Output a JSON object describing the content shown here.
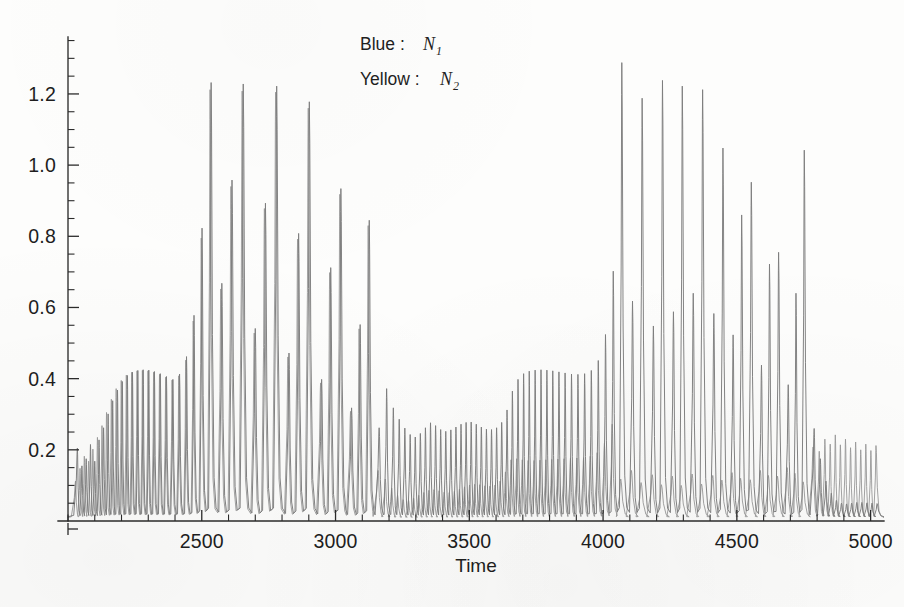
{
  "figure": {
    "background_color": "#fdfdfc",
    "ink_color": "#2b2b2b"
  },
  "legend": {
    "position": "top-center",
    "entries": [
      {
        "label": "Blue :",
        "variable": "N",
        "subscript": "1",
        "series_key": "N1",
        "color": "#7d7d7d"
      },
      {
        "label": "Yellow :",
        "variable": "N",
        "subscript": "2",
        "series_key": "N2",
        "color": "#9a9a9a"
      }
    ]
  },
  "axes": {
    "x": {
      "label": "Time",
      "min": 2000,
      "max": 5050,
      "major_ticks": [
        2500,
        3000,
        3500,
        4000,
        4500,
        5000
      ],
      "major_tick_labels": [
        "2500",
        "3000",
        "3500",
        "4000",
        "4500",
        "5000"
      ],
      "minor_tick_step": 100,
      "tick_direction": "inward"
    },
    "y": {
      "label": "",
      "min": 0.0,
      "max": 1.36,
      "major_ticks": [
        0.2,
        0.4,
        0.6,
        0.8,
        1.0,
        1.2
      ],
      "major_tick_labels": [
        "0.2",
        "0.4",
        "0.6",
        "0.8",
        "1.0",
        "1.2"
      ],
      "minor_tick_step": 0.05,
      "tick_direction": "inward"
    },
    "grid": false,
    "frame": "left-and-bottom-spines-only"
  },
  "chart_data": {
    "type": "line",
    "title": "",
    "xlabel": "Time",
    "ylabel": "",
    "xlim": [
      2000,
      5050
    ],
    "ylim": [
      0.0,
      1.36
    ],
    "grid": false,
    "legend_position": "top-center",
    "series": [
      {
        "name": "N1",
        "legend": "Blue : N1",
        "color": "#7d7d7d",
        "baseline": 0.012,
        "spike_peaks": [
          {
            "t": 2035,
            "y": 0.205
          },
          {
            "t": 2052,
            "y": 0.155
          },
          {
            "t": 2068,
            "y": 0.175
          },
          {
            "t": 2084,
            "y": 0.215
          },
          {
            "t": 2100,
            "y": 0.168
          },
          {
            "t": 2116,
            "y": 0.228
          },
          {
            "t": 2133,
            "y": 0.262
          },
          {
            "t": 2150,
            "y": 0.301
          },
          {
            "t": 2167,
            "y": 0.338
          },
          {
            "t": 2185,
            "y": 0.368
          },
          {
            "t": 2203,
            "y": 0.392
          },
          {
            "t": 2222,
            "y": 0.409
          },
          {
            "t": 2241,
            "y": 0.418
          },
          {
            "t": 2261,
            "y": 0.423
          },
          {
            "t": 2281,
            "y": 0.425
          },
          {
            "t": 2302,
            "y": 0.424
          },
          {
            "t": 2323,
            "y": 0.42
          },
          {
            "t": 2345,
            "y": 0.414
          },
          {
            "t": 2368,
            "y": 0.406
          },
          {
            "t": 2392,
            "y": 0.398
          },
          {
            "t": 2417,
            "y": 0.413
          },
          {
            "t": 2443,
            "y": 0.462
          },
          {
            "t": 2471,
            "y": 0.578
          },
          {
            "t": 2501,
            "y": 0.823
          },
          {
            "t": 2535,
            "y": 1.232
          },
          {
            "t": 2575,
            "y": 0.668
          },
          {
            "t": 2613,
            "y": 0.958
          },
          {
            "t": 2655,
            "y": 1.228
          },
          {
            "t": 2700,
            "y": 0.541
          },
          {
            "t": 2738,
            "y": 0.893
          },
          {
            "t": 2780,
            "y": 1.222
          },
          {
            "t": 2826,
            "y": 0.472
          },
          {
            "t": 2862,
            "y": 0.808
          },
          {
            "t": 2902,
            "y": 1.178
          },
          {
            "t": 2948,
            "y": 0.398
          },
          {
            "t": 2982,
            "y": 0.712
          },
          {
            "t": 3020,
            "y": 0.934
          },
          {
            "t": 3060,
            "y": 0.318
          },
          {
            "t": 3092,
            "y": 0.552
          },
          {
            "t": 3126,
            "y": 0.845
          },
          {
            "t": 3163,
            "y": 0.262
          },
          {
            "t": 3191,
            "y": 0.372
          },
          {
            "t": 3216,
            "y": 0.318
          },
          {
            "t": 3238,
            "y": 0.286
          },
          {
            "t": 3259,
            "y": 0.261
          },
          {
            "t": 3279,
            "y": 0.243
          },
          {
            "t": 3298,
            "y": 0.236
          },
          {
            "t": 3317,
            "y": 0.246
          },
          {
            "t": 3336,
            "y": 0.262
          },
          {
            "t": 3355,
            "y": 0.276
          },
          {
            "t": 3374,
            "y": 0.268
          },
          {
            "t": 3393,
            "y": 0.257
          },
          {
            "t": 3412,
            "y": 0.252
          },
          {
            "t": 3431,
            "y": 0.256
          },
          {
            "t": 3450,
            "y": 0.264
          },
          {
            "t": 3469,
            "y": 0.272
          },
          {
            "t": 3488,
            "y": 0.277
          },
          {
            "t": 3507,
            "y": 0.278
          },
          {
            "t": 3526,
            "y": 0.272
          },
          {
            "t": 3545,
            "y": 0.264
          },
          {
            "t": 3564,
            "y": 0.258
          },
          {
            "t": 3583,
            "y": 0.257
          },
          {
            "t": 3602,
            "y": 0.262
          },
          {
            "t": 3621,
            "y": 0.277
          },
          {
            "t": 3641,
            "y": 0.312
          },
          {
            "t": 3661,
            "y": 0.365
          },
          {
            "t": 3682,
            "y": 0.398
          },
          {
            "t": 3703,
            "y": 0.414
          },
          {
            "t": 3724,
            "y": 0.421
          },
          {
            "t": 3746,
            "y": 0.424
          },
          {
            "t": 3768,
            "y": 0.425
          },
          {
            "t": 3790,
            "y": 0.424
          },
          {
            "t": 3812,
            "y": 0.422
          },
          {
            "t": 3835,
            "y": 0.419
          },
          {
            "t": 3858,
            "y": 0.416
          },
          {
            "t": 3882,
            "y": 0.413
          },
          {
            "t": 3906,
            "y": 0.412
          },
          {
            "t": 3931,
            "y": 0.414
          },
          {
            "t": 3956,
            "y": 0.423
          },
          {
            "t": 3982,
            "y": 0.451
          },
          {
            "t": 4009,
            "y": 0.524
          },
          {
            "t": 4038,
            "y": 0.702
          },
          {
            "t": 4070,
            "y": 1.288
          },
          {
            "t": 4110,
            "y": 0.618
          },
          {
            "t": 4146,
            "y": 1.188
          },
          {
            "t": 4188,
            "y": 0.548
          },
          {
            "t": 4222,
            "y": 1.238
          },
          {
            "t": 4263,
            "y": 0.588
          },
          {
            "t": 4296,
            "y": 1.222
          },
          {
            "t": 4337,
            "y": 0.64
          },
          {
            "t": 4372,
            "y": 1.212
          },
          {
            "t": 4414,
            "y": 0.583
          },
          {
            "t": 4448,
            "y": 1.048
          },
          {
            "t": 4486,
            "y": 0.523
          },
          {
            "t": 4518,
            "y": 0.86
          },
          {
            "t": 4554,
            "y": 0.952
          },
          {
            "t": 4592,
            "y": 0.438
          },
          {
            "t": 4622,
            "y": 0.722
          },
          {
            "t": 4656,
            "y": 0.755
          },
          {
            "t": 4692,
            "y": 0.383
          },
          {
            "t": 4721,
            "y": 0.64
          },
          {
            "t": 4752,
            "y": 1.042
          },
          {
            "t": 4789,
            "y": 0.26
          },
          {
            "t": 4812,
            "y": 0.175
          },
          {
            "t": 4833,
            "y": 0.112
          },
          {
            "t": 4853,
            "y": 0.078
          },
          {
            "t": 4872,
            "y": 0.058
          },
          {
            "t": 4891,
            "y": 0.05
          },
          {
            "t": 4910,
            "y": 0.048
          },
          {
            "t": 4929,
            "y": 0.05
          },
          {
            "t": 4948,
            "y": 0.052
          },
          {
            "t": 4967,
            "y": 0.052
          },
          {
            "t": 4986,
            "y": 0.051
          },
          {
            "t": 5005,
            "y": 0.05
          },
          {
            "t": 5024,
            "y": 0.049
          }
        ]
      },
      {
        "name": "N2",
        "legend": "Yellow : N2",
        "color": "#9a9a9a",
        "baseline": 0.01,
        "spike_peaks": [
          {
            "t": 2028,
            "y": 0.112
          },
          {
            "t": 2045,
            "y": 0.148
          },
          {
            "t": 2061,
            "y": 0.182
          },
          {
            "t": 2077,
            "y": 0.168
          },
          {
            "t": 2093,
            "y": 0.202
          },
          {
            "t": 2110,
            "y": 0.235
          },
          {
            "t": 2127,
            "y": 0.268
          },
          {
            "t": 2144,
            "y": 0.305
          },
          {
            "t": 2162,
            "y": 0.342
          },
          {
            "t": 2180,
            "y": 0.372
          },
          {
            "t": 2199,
            "y": 0.395
          },
          {
            "t": 2218,
            "y": 0.41
          },
          {
            "t": 2238,
            "y": 0.418
          },
          {
            "t": 2258,
            "y": 0.422
          },
          {
            "t": 2278,
            "y": 0.423
          },
          {
            "t": 2299,
            "y": 0.422
          },
          {
            "t": 2320,
            "y": 0.418
          },
          {
            "t": 2342,
            "y": 0.412
          },
          {
            "t": 2365,
            "y": 0.404
          },
          {
            "t": 2389,
            "y": 0.396
          },
          {
            "t": 2414,
            "y": 0.408
          },
          {
            "t": 2440,
            "y": 0.452
          },
          {
            "t": 2468,
            "y": 0.562
          },
          {
            "t": 2498,
            "y": 0.795
          },
          {
            "t": 2531,
            "y": 1.212
          },
          {
            "t": 2571,
            "y": 0.652
          },
          {
            "t": 2609,
            "y": 0.94
          },
          {
            "t": 2651,
            "y": 1.208
          },
          {
            "t": 2696,
            "y": 0.528
          },
          {
            "t": 2734,
            "y": 0.878
          },
          {
            "t": 2776,
            "y": 1.205
          },
          {
            "t": 2822,
            "y": 0.461
          },
          {
            "t": 2858,
            "y": 0.792
          },
          {
            "t": 2898,
            "y": 1.16
          },
          {
            "t": 2944,
            "y": 0.388
          },
          {
            "t": 2978,
            "y": 0.698
          },
          {
            "t": 3016,
            "y": 0.918
          },
          {
            "t": 3056,
            "y": 0.308
          },
          {
            "t": 3088,
            "y": 0.54
          },
          {
            "t": 3122,
            "y": 0.83
          },
          {
            "t": 3159,
            "y": 0.142
          },
          {
            "t": 3186,
            "y": 0.118
          },
          {
            "t": 3210,
            "y": 0.092
          },
          {
            "t": 3232,
            "y": 0.072
          },
          {
            "t": 3253,
            "y": 0.06
          },
          {
            "t": 3273,
            "y": 0.058
          },
          {
            "t": 3292,
            "y": 0.064
          },
          {
            "t": 3311,
            "y": 0.072
          },
          {
            "t": 3330,
            "y": 0.08
          },
          {
            "t": 3349,
            "y": 0.086
          },
          {
            "t": 3368,
            "y": 0.088
          },
          {
            "t": 3387,
            "y": 0.085
          },
          {
            "t": 3406,
            "y": 0.081
          },
          {
            "t": 3425,
            "y": 0.08
          },
          {
            "t": 3444,
            "y": 0.083
          },
          {
            "t": 3463,
            "y": 0.089
          },
          {
            "t": 3482,
            "y": 0.096
          },
          {
            "t": 3501,
            "y": 0.101
          },
          {
            "t": 3520,
            "y": 0.103
          },
          {
            "t": 3539,
            "y": 0.102
          },
          {
            "t": 3558,
            "y": 0.099
          },
          {
            "t": 3577,
            "y": 0.098
          },
          {
            "t": 3596,
            "y": 0.101
          },
          {
            "t": 3615,
            "y": 0.112
          },
          {
            "t": 3635,
            "y": 0.138
          },
          {
            "t": 3656,
            "y": 0.172
          },
          {
            "t": 3677,
            "y": 0.175
          },
          {
            "t": 3698,
            "y": 0.172
          },
          {
            "t": 3720,
            "y": 0.17
          },
          {
            "t": 3742,
            "y": 0.17
          },
          {
            "t": 3764,
            "y": 0.171
          },
          {
            "t": 3786,
            "y": 0.172
          },
          {
            "t": 3808,
            "y": 0.173
          },
          {
            "t": 3831,
            "y": 0.174
          },
          {
            "t": 3854,
            "y": 0.175
          },
          {
            "t": 3878,
            "y": 0.176
          },
          {
            "t": 3902,
            "y": 0.177
          },
          {
            "t": 3927,
            "y": 0.178
          },
          {
            "t": 3952,
            "y": 0.182
          },
          {
            "t": 3978,
            "y": 0.192
          },
          {
            "t": 4005,
            "y": 0.218
          },
          {
            "t": 4034,
            "y": 0.272
          },
          {
            "t": 4066,
            "y": 0.118
          },
          {
            "t": 4106,
            "y": 0.142
          },
          {
            "t": 4142,
            "y": 0.108
          },
          {
            "t": 4184,
            "y": 0.13
          },
          {
            "t": 4218,
            "y": 0.102
          },
          {
            "t": 4259,
            "y": 0.126
          },
          {
            "t": 4292,
            "y": 0.1
          },
          {
            "t": 4333,
            "y": 0.132
          },
          {
            "t": 4368,
            "y": 0.104
          },
          {
            "t": 4410,
            "y": 0.128
          },
          {
            "t": 4444,
            "y": 0.115
          },
          {
            "t": 4482,
            "y": 0.136
          },
          {
            "t": 4514,
            "y": 0.12
          },
          {
            "t": 4550,
            "y": 0.116
          },
          {
            "t": 4588,
            "y": 0.142
          },
          {
            "t": 4618,
            "y": 0.128
          },
          {
            "t": 4652,
            "y": 0.126
          },
          {
            "t": 4688,
            "y": 0.15
          },
          {
            "t": 4717,
            "y": 0.134
          },
          {
            "t": 4748,
            "y": 0.11
          },
          {
            "t": 4785,
            "y": 0.208
          },
          {
            "t": 4808,
            "y": 0.196
          },
          {
            "t": 4829,
            "y": 0.23
          },
          {
            "t": 4849,
            "y": 0.216
          },
          {
            "t": 4868,
            "y": 0.242
          },
          {
            "t": 4887,
            "y": 0.214
          },
          {
            "t": 4906,
            "y": 0.23
          },
          {
            "t": 4925,
            "y": 0.206
          },
          {
            "t": 4944,
            "y": 0.222
          },
          {
            "t": 4963,
            "y": 0.2
          },
          {
            "t": 4982,
            "y": 0.216
          },
          {
            "t": 5001,
            "y": 0.198
          },
          {
            "t": 5020,
            "y": 0.212
          }
        ]
      }
    ]
  }
}
